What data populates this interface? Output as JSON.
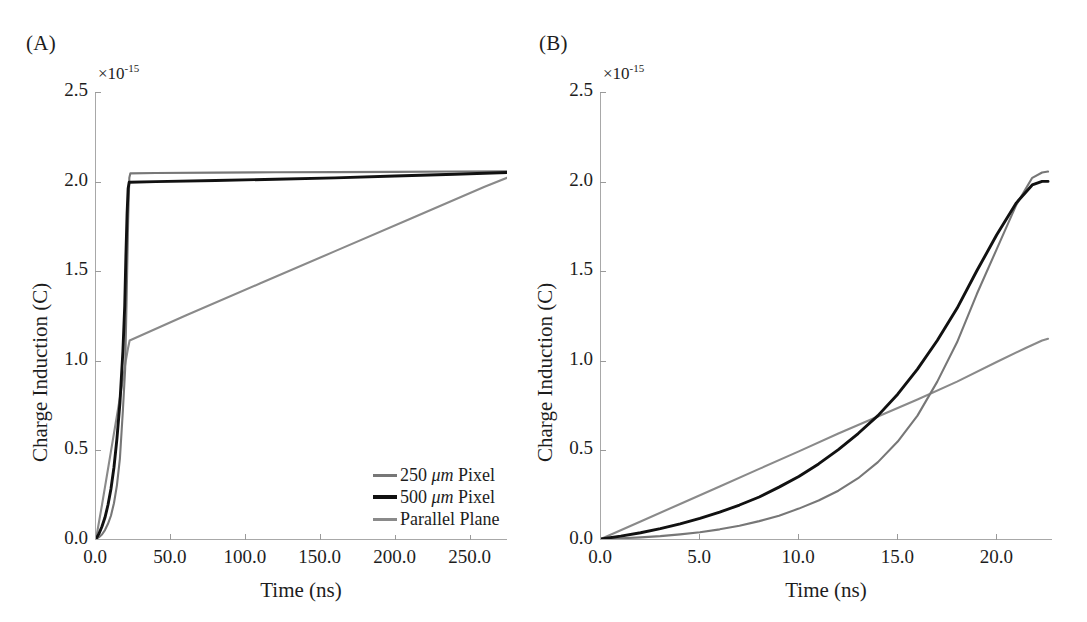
{
  "figure": {
    "panels": [
      {
        "id": "A",
        "label": "(A)",
        "exponent_prefix": "×10",
        "exponent_power": "-15"
      },
      {
        "id": "B",
        "label": "(B)",
        "exponent_prefix": "×10",
        "exponent_power": "-15"
      }
    ]
  },
  "series_colors": {
    "pixel_250": "#777777",
    "pixel_500": "#111111",
    "parallel_plane": "#8a8a8a",
    "axis": "#9a9a9a",
    "text": "#1d1d1d"
  },
  "legend": {
    "entries": [
      {
        "label": "250 μm Pixel",
        "label_num": "250 ",
        "label_unit": "μm",
        "label_rest": " Pixel",
        "color": "#777777",
        "thickness": "3px"
      },
      {
        "label": "500 μm Pixel",
        "label_num": "500 ",
        "label_unit": "μm",
        "label_rest": " Pixel",
        "color": "#111111",
        "thickness": "4px"
      },
      {
        "label": "Parallel Plane",
        "label_num": "Parallel Plane",
        "label_unit": "",
        "label_rest": "",
        "color": "#8a8a8a",
        "thickness": "3px"
      }
    ]
  },
  "chart_data": [
    {
      "type": "line",
      "panel": "A",
      "title": "(A)",
      "xlabel": "Time (ns)",
      "ylabel": "Charge Induction (C)",
      "y_multiplier": "×10^-15",
      "xlim": [
        0,
        275
      ],
      "ylim": [
        0,
        2.5
      ],
      "xticks": [
        0.0,
        50.0,
        100.0,
        150.0,
        200.0,
        250.0
      ],
      "xticklabels": [
        "0.0",
        "50.0",
        "100.0",
        "150.0",
        "200.0",
        "250.0"
      ],
      "yticks": [
        0.0,
        0.5,
        1.0,
        1.5,
        2.0,
        2.5
      ],
      "yticklabels": [
        "0.0",
        "0.5",
        "1.0",
        "1.5",
        "2.0",
        "2.5"
      ],
      "grid": false,
      "legend_position": "lower-right",
      "series": [
        {
          "name": "250 μm Pixel",
          "color": "#777777",
          "x": [
            0,
            2,
            4,
            6,
            8,
            10,
            12,
            14,
            16,
            18,
            19.5,
            20.5,
            21.5,
            22.3,
            23.0,
            40,
            80,
            120,
            160,
            200,
            240,
            275
          ],
          "y": [
            0.0,
            0.01,
            0.025,
            0.05,
            0.085,
            0.13,
            0.2,
            0.3,
            0.45,
            0.72,
            0.95,
            1.35,
            1.78,
            2.02,
            2.045,
            2.047,
            2.049,
            2.051,
            2.052,
            2.053,
            2.055,
            2.056
          ]
        },
        {
          "name": "500 μm Pixel",
          "color": "#111111",
          "x": [
            0,
            2,
            4,
            6,
            8,
            10,
            12,
            14,
            16,
            18,
            19.2,
            20.0,
            20.8,
            21.5,
            22.2,
            40,
            80,
            120,
            160,
            200,
            240,
            275
          ],
          "y": [
            0.0,
            0.03,
            0.07,
            0.12,
            0.19,
            0.28,
            0.4,
            0.56,
            0.76,
            1.05,
            1.3,
            1.58,
            1.82,
            1.96,
            1.995,
            1.999,
            2.005,
            2.012,
            2.02,
            2.03,
            2.04,
            2.05
          ]
        },
        {
          "name": "Parallel Plane",
          "color": "#8a8a8a",
          "x": [
            0,
            2,
            4,
            6,
            8,
            10,
            12,
            14,
            16,
            18,
            20,
            21.5,
            22.5,
            60,
            110,
            160,
            210,
            260,
            275
          ],
          "y": [
            0.0,
            0.095,
            0.19,
            0.29,
            0.39,
            0.49,
            0.59,
            0.69,
            0.79,
            0.89,
            1.0,
            1.07,
            1.11,
            1.25,
            1.43,
            1.61,
            1.79,
            1.97,
            2.02
          ]
        }
      ]
    },
    {
      "type": "line",
      "panel": "B",
      "title": "(B)",
      "xlabel": "Time (ns)",
      "ylabel": "Charge Induction (C)",
      "y_multiplier": "×10^-15",
      "xlim": [
        0,
        22.8
      ],
      "ylim": [
        0,
        2.5
      ],
      "xticks": [
        0.0,
        5.0,
        10.0,
        15.0,
        20.0
      ],
      "xticklabels": [
        "0.0",
        "5.0",
        "10.0",
        "15.0",
        "20.0"
      ],
      "yticks": [
        0.0,
        0.5,
        1.0,
        1.5,
        2.0,
        2.5
      ],
      "yticklabels": [
        "0.0",
        "0.5",
        "1.0",
        "1.5",
        "2.0",
        "2.5"
      ],
      "grid": false,
      "legend_position": "upper-left",
      "series": [
        {
          "name": "250 μm Pixel",
          "color": "#777777",
          "x": [
            0,
            1,
            2,
            3,
            4,
            5,
            6,
            7,
            8,
            9,
            10,
            11,
            12,
            13,
            14,
            15,
            16,
            17,
            18,
            19,
            20,
            21,
            21.8,
            22.3,
            22.6
          ],
          "y": [
            0.0,
            0.004,
            0.009,
            0.016,
            0.026,
            0.038,
            0.054,
            0.074,
            0.1,
            0.13,
            0.17,
            0.215,
            0.27,
            0.34,
            0.43,
            0.545,
            0.69,
            0.88,
            1.1,
            1.37,
            1.62,
            1.87,
            2.02,
            2.05,
            2.055
          ]
        },
        {
          "name": "500 μm Pixel",
          "color": "#111111",
          "x": [
            0,
            1,
            2,
            3,
            4,
            5,
            6,
            7,
            8,
            9,
            10,
            11,
            12,
            13,
            14,
            15,
            16,
            17,
            18,
            19,
            20,
            21,
            21.8,
            22.3,
            22.6
          ],
          "y": [
            0.0,
            0.016,
            0.035,
            0.058,
            0.085,
            0.115,
            0.15,
            0.19,
            0.235,
            0.29,
            0.35,
            0.42,
            0.5,
            0.59,
            0.69,
            0.81,
            0.95,
            1.11,
            1.29,
            1.5,
            1.7,
            1.88,
            1.98,
            2.0,
            2.0
          ]
        },
        {
          "name": "Parallel Plane",
          "color": "#8a8a8a",
          "x": [
            0,
            2,
            4,
            6,
            8,
            10,
            12,
            14,
            16,
            18,
            20,
            21.5,
            22.3,
            22.6
          ],
          "y": [
            0.0,
            0.098,
            0.196,
            0.294,
            0.392,
            0.49,
            0.59,
            0.685,
            0.78,
            0.88,
            0.99,
            1.07,
            1.11,
            1.12
          ]
        }
      ]
    }
  ]
}
